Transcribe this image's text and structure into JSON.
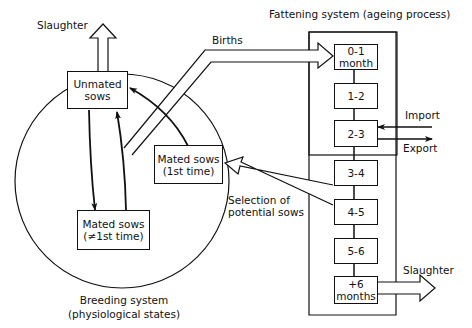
{
  "diagram": {
    "fattening_system": {
      "title": "Fattening system  (ageing process)",
      "stages": [
        {
          "line1": "0-1",
          "line2": "month"
        },
        {
          "line1": "1-2",
          "line2": ""
        },
        {
          "line1": "2-3",
          "line2": ""
        },
        {
          "line1": "3-4",
          "line2": ""
        },
        {
          "line1": "4-5",
          "line2": ""
        },
        {
          "line1": "5-6",
          "line2": ""
        },
        {
          "line1": "+6",
          "line2": "months"
        }
      ]
    },
    "breeding_system": {
      "title_line1": "Breeding system",
      "title_line2": "(physiological states)",
      "states": {
        "unmated": {
          "line1": "Unmated",
          "line2": "sows"
        },
        "mated_first": {
          "line1": "Mated sows",
          "line2": "(1st time)"
        },
        "mated_not_first": {
          "line1": "Mated sows",
          "line2": "(≠1st time)"
        }
      }
    },
    "flows": {
      "births": "Births",
      "import": "Import",
      "export": "Export",
      "selection_line1": "Selection of",
      "selection_line2": "potential sows",
      "slaughter_breeding": "Slaughter",
      "slaughter_fattening": "Slaughter"
    }
  }
}
